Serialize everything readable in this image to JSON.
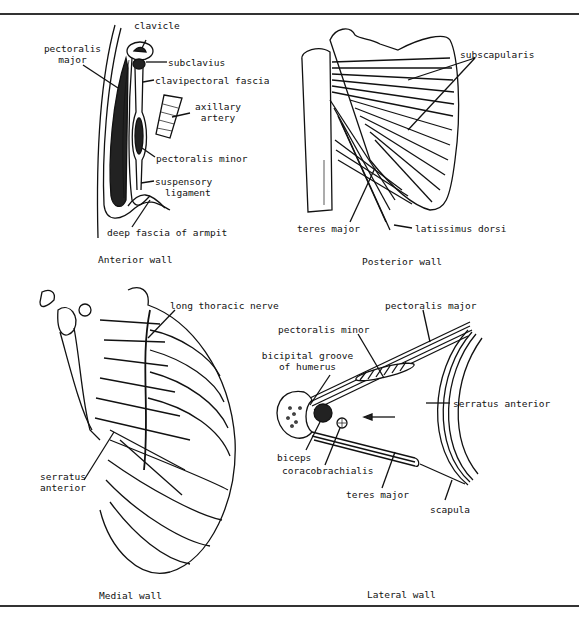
{
  "figure": {
    "panels": [
      {
        "id": "anterior",
        "caption": "Anterior wall",
        "labels": {
          "clavicle": "clavicle",
          "pectoralis_major": [
            "pectoralis",
            "major"
          ],
          "subclavius": "subclavius",
          "clavipectoral_fascia": "clavipectoral fascia",
          "axillary_artery": [
            "axillary",
            "artery"
          ],
          "pectoralis_minor": "pectoralis minor",
          "suspensory_ligament": [
            "suspensory",
            "ligament"
          ],
          "deep_fascia": "deep fascia of armpit"
        }
      },
      {
        "id": "posterior",
        "caption": "Posterior wall",
        "labels": {
          "subscapularis": "subscapularis",
          "teres_major": "teres major",
          "latissimus_dorsi": "latissimus dorsi"
        }
      },
      {
        "id": "medial",
        "caption": "Medial wall",
        "labels": {
          "long_thoracic_nerve": "long thoracic nerve",
          "serratus_anterior": [
            "serratus",
            "anterior"
          ]
        }
      },
      {
        "id": "lateral",
        "caption": "Lateral wall",
        "labels": {
          "pectoralis_major": "pectoralis major",
          "pectoralis_minor": "pectoralis minor",
          "bicipital_groove": [
            "bicipital groove",
            "of humerus"
          ],
          "serratus_anterior": "serratus anterior",
          "biceps": "biceps",
          "coracobrachialis": "coracobrachialis",
          "teres_major": "teres major",
          "scapula": "scapula"
        }
      }
    ]
  }
}
